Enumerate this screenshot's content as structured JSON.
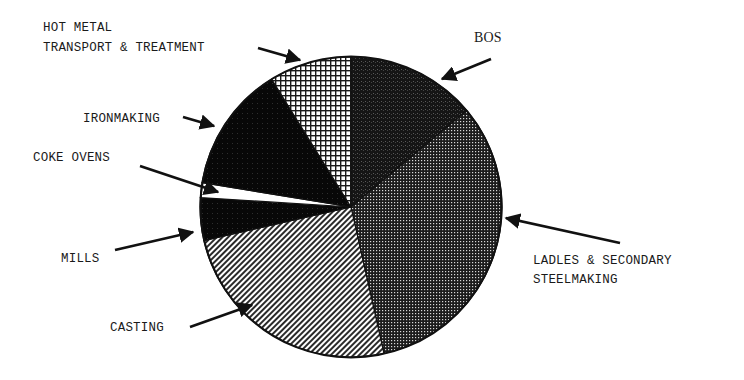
{
  "chart_data": {
    "type": "pie",
    "title": "",
    "start_angle_deg": -90,
    "direction": "clockwise",
    "center": [
      351,
      207
    ],
    "radius": [
      151,
      150
    ],
    "slices": [
      {
        "label": "BOS",
        "value": 13.9,
        "pattern": "dense-speckle-dark",
        "color": "#1e1e1e"
      },
      {
        "label": "LADLES & SECONDARY STEELMAKING",
        "value": 32.6,
        "pattern": "fine-dot-grid",
        "color": "#3a3a3a"
      },
      {
        "label": "CASTING",
        "value": 24.9,
        "pattern": "diagonal-hatch",
        "color": "#6a6a6a"
      },
      {
        "label": "MILLS",
        "value": 4.6,
        "pattern": "solid-black",
        "color": "#080808"
      },
      {
        "label": "COKE OVENS",
        "value": 1.6,
        "pattern": "white",
        "color": "#ffffff"
      },
      {
        "label": "IRONMAKING",
        "value": 13.6,
        "pattern": "solid-black-speckle",
        "color": "#0c0c0c"
      },
      {
        "label": "HOT METAL TRANSPORT & TREATMENT",
        "value": 8.8,
        "pattern": "open-grid",
        "color": "#bdbdbd"
      }
    ],
    "legend": "none (callout labels with arrows)"
  },
  "labels": {
    "bos": "BOS",
    "hot_metal_line1": "HOT METAL",
    "hot_metal_line2": "TRANSPORT & TREATMENT",
    "ironmaking": "IRONMAKING",
    "coke_ovens": "COKE OVENS",
    "mills": "MILLS",
    "casting": "CASTING",
    "ladles_line1": "LADLES & SECONDARY",
    "ladles_line2": "STEELMAKING"
  }
}
